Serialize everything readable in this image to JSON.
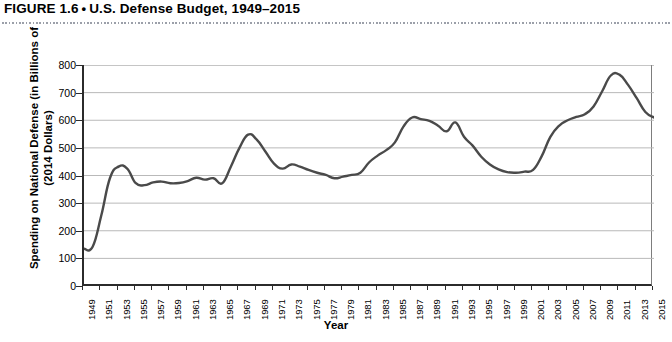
{
  "figure": {
    "number_label": "FIGURE 1.6",
    "bullet": "•",
    "title": "U.S. Defense Budget, 1949–2015"
  },
  "chart_data": {
    "type": "line",
    "title": "U.S. Defense Budget, 1949–2015",
    "xlabel": "Year",
    "ylabel_line1": "Spending on National Defense (in Billions of",
    "ylabel_line2": "(2014 Dollars)",
    "ylim": [
      0,
      800
    ],
    "ytick_values": [
      800,
      700,
      600,
      500,
      400,
      300,
      200,
      100,
      0
    ],
    "ytick_labels": [
      "800",
      "700",
      "600",
      "500",
      "400",
      "300",
      "200",
      "100",
      "0"
    ],
    "xlim": [
      1949,
      2015
    ],
    "xtick_labels": [
      "1949",
      "1951",
      "1953",
      "1955",
      "1957",
      "1959",
      "1961",
      "1963",
      "1965",
      "1967",
      "1969",
      "1971",
      "1973",
      "1975",
      "1977",
      "1979",
      "1981",
      "1983",
      "1985",
      "1987",
      "1989",
      "1991",
      "1993",
      "1995",
      "1997",
      "1999",
      "2001",
      "2003",
      "2005",
      "2007",
      "2009",
      "2011",
      "2013",
      "2015"
    ],
    "xtick_step_years": 2,
    "grid": "horizontal",
    "legend": "none",
    "line_color": "#4a4a4a",
    "line_width": 2.4,
    "series": [
      {
        "name": "Spending on National Defense (2014 Dollars)",
        "x": [
          1949,
          1950,
          1951,
          1952,
          1953,
          1954,
          1955,
          1956,
          1957,
          1958,
          1959,
          1960,
          1961,
          1962,
          1963,
          1964,
          1965,
          1966,
          1967,
          1968,
          1969,
          1970,
          1971,
          1972,
          1973,
          1974,
          1975,
          1976,
          1977,
          1978,
          1979,
          1980,
          1981,
          1982,
          1983,
          1984,
          1985,
          1986,
          1987,
          1988,
          1989,
          1990,
          1991,
          1992,
          1993,
          1994,
          1995,
          1996,
          1997,
          1998,
          1999,
          2000,
          2001,
          2002,
          2003,
          2004,
          2005,
          2006,
          2007,
          2008,
          2009,
          2010,
          2011,
          2012,
          2013,
          2014,
          2015
        ],
        "values": [
          135,
          142,
          255,
          390,
          432,
          425,
          372,
          365,
          375,
          378,
          372,
          373,
          380,
          392,
          385,
          390,
          372,
          432,
          500,
          548,
          530,
          487,
          443,
          425,
          440,
          432,
          420,
          410,
          402,
          390,
          396,
          402,
          410,
          447,
          472,
          492,
          520,
          578,
          610,
          604,
          598,
          580,
          560,
          592,
          540,
          508,
          468,
          440,
          422,
          412,
          410,
          414,
          420,
          470,
          540,
          580,
          600,
          612,
          622,
          650,
          705,
          762,
          765,
          728,
          680,
          630,
          610
        ],
        "annotations": [
          {
            "label": "Korean War buildup peak",
            "year": 1953,
            "value": 432
          },
          {
            "label": "Vietnam War peak",
            "year": 1968,
            "value": 548
          },
          {
            "label": "Reagan buildup peak",
            "year": 1987,
            "value": 610
          },
          {
            "label": "Gulf War spike",
            "year": 1992,
            "value": 592
          },
          {
            "label": "Post-Cold War trough",
            "year": 1999,
            "value": 410
          },
          {
            "label": "Iraq/Afghanistan peak",
            "year": 2011,
            "value": 765
          }
        ]
      }
    ]
  }
}
